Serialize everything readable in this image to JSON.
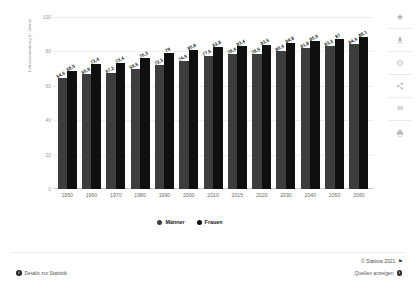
{
  "chart_data": {
    "type": "bar",
    "title": "",
    "subtitle": "",
    "xlabel": "",
    "ylabel": "Lebenserwartung in Jahren",
    "ylim": [
      0,
      100
    ],
    "yticks": [
      0,
      20,
      40,
      60,
      80,
      100
    ],
    "ytick_labels": [
      "0",
      "20",
      "40",
      "60",
      "80",
      "100"
    ],
    "grid": true,
    "legend_position": "bottom-center",
    "categories": [
      "1950",
      "1960",
      "1970",
      "1980",
      "1990",
      "2000",
      "2010",
      "2015",
      "2020",
      "2030",
      "2040",
      "2050",
      "2060"
    ],
    "series": [
      {
        "name": "Männer",
        "color": "#3d3d3d",
        "values": [
          64.6,
          66.9,
          67.2,
          69.6,
          72.3,
          74.5,
          77.6,
          78.4,
          78.5,
          80.4,
          81.8,
          83.2,
          84.4
        ],
        "labels": [
          "64,6",
          "66,9",
          "67,2",
          "69,6",
          "72,3",
          "74,5",
          "77,6",
          "78,4",
          "78,5",
          "80,4",
          "81,8",
          "83,2",
          "84,4"
        ]
      },
      {
        "name": "Frauen",
        "color": "#0f0f0f",
        "values": [
          68.5,
          72.4,
          73.4,
          76.3,
          79.0,
          80.8,
          82.8,
          83.4,
          83.6,
          84.8,
          85.9,
          87.0,
          88.1
        ],
        "labels": [
          "68,5",
          "72,4",
          "73,4",
          "76,3",
          "79",
          "80,8",
          "82,8",
          "83,4",
          "83,6",
          "84,8",
          "85,9",
          "87",
          "88,1"
        ]
      }
    ]
  },
  "legend": {
    "items": [
      {
        "label": "Männer"
      },
      {
        "label": "Frauen"
      }
    ]
  },
  "toolbar": {
    "items": [
      {
        "name": "favorite-icon",
        "title": "Favorit"
      },
      {
        "name": "download-icon",
        "title": "Download"
      },
      {
        "name": "info-icon",
        "title": "Info"
      },
      {
        "name": "share-icon",
        "title": "Teilen"
      },
      {
        "name": "quote-icon",
        "title": "Zitieren",
        "glyph": "99"
      },
      {
        "name": "print-icon",
        "title": "Drucken"
      }
    ]
  },
  "footer": {
    "details_link": "Details zur Statistik",
    "copyright": "© Statista 2021",
    "sources_link": "Quellen anzeigen"
  }
}
